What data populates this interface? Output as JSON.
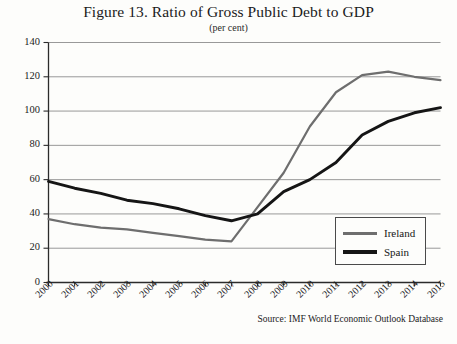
{
  "chart_data": {
    "type": "line",
    "title": "Figure 13. Ratio of Gross Public Debt to GDP",
    "subtitle": "(per cent)",
    "xlabel": "",
    "ylabel": "",
    "ylim": [
      0,
      140
    ],
    "yticks": [
      0,
      20,
      40,
      60,
      80,
      100,
      120,
      140
    ],
    "grid": true,
    "legend_position": "bottom-right",
    "categories": [
      "2000",
      "2001",
      "2002",
      "2003",
      "2004",
      "2005",
      "2006",
      "2007",
      "2008",
      "2009",
      "2010",
      "2011",
      "2012",
      "2013",
      "2014",
      "2015"
    ],
    "series": [
      {
        "name": "Ireland",
        "color": "#6e6e6e",
        "values": [
          37,
          34,
          32,
          31,
          29,
          27,
          25,
          24,
          44,
          64,
          91,
          111,
          121,
          123,
          120,
          118
        ]
      },
      {
        "name": "Spain",
        "color": "#151515",
        "values": [
          59,
          55,
          52,
          48,
          46,
          43,
          39,
          36,
          40,
          53,
          60,
          70,
          86,
          94,
          99,
          102
        ]
      }
    ],
    "source_note": "Source: IMF World Economic Outlook Database"
  },
  "legend": {
    "items": [
      {
        "label": "Ireland"
      },
      {
        "label": "Spain"
      }
    ]
  }
}
